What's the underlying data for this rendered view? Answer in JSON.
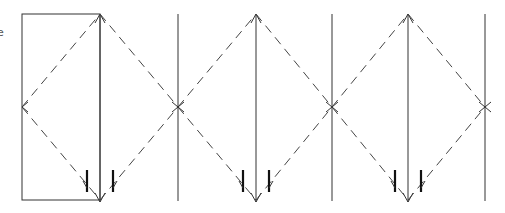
{
  "diagram": {
    "edge_label": "e",
    "colors": {
      "line": "#333333",
      "dashed": "#444444",
      "mark": "#111111",
      "background": "#ffffff"
    },
    "mirrors": [
      {
        "id": "m0",
        "style": "box-left"
      },
      {
        "id": "m1",
        "style": "double-arrow-first"
      },
      {
        "id": "m2",
        "style": "plain"
      },
      {
        "id": "m3",
        "style": "double-arrow"
      },
      {
        "id": "m4",
        "style": "plain"
      },
      {
        "id": "m5",
        "style": "double-arrow"
      },
      {
        "id": "m6",
        "style": "plain"
      }
    ],
    "mark_pairs": 3
  }
}
